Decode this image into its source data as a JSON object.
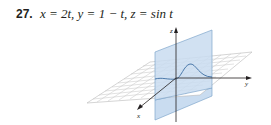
{
  "exercise": {
    "number": "27.",
    "equation": "x = 2t, y = 1 − t, z = sin t"
  },
  "figure": {
    "axis_labels": {
      "x": "x",
      "y": "y",
      "z": "z"
    },
    "colors": {
      "plane_fill": "#c9dcf0",
      "plane_stroke": "#7fa6cc",
      "grid_line": "#b8b8b8",
      "axis": "#231f20",
      "curve": "#3d6ea3"
    }
  }
}
